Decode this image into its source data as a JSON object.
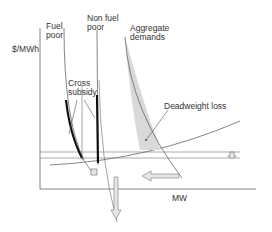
{
  "diagram": {
    "y_axis_label": "$/MWh",
    "x_axis_label": "MW",
    "labels": {
      "fuel_poor": "Fuel\npoor",
      "non_fuel_poor": "Non fuel\npoor",
      "aggregate_demands": "Aggregate\ndemands",
      "cross_subsidy": "Cross\nsubsidy",
      "deadweight_loss": "Deadweight loss"
    },
    "colors": {
      "line": "#555555",
      "demand_curve_bold": "#111111",
      "shaded_area": "#d9d9d9",
      "arrow_fill": "#e6e6e6"
    }
  }
}
